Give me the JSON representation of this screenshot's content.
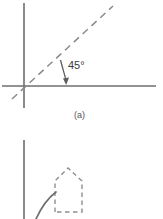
{
  "figure": {
    "background_color": "#ffffff",
    "ink_color": "#6e6e6e",
    "dash_color": "#8a8a8a",
    "panel_a": {
      "caption": "(a)",
      "angle_label": "45°",
      "axes": {
        "origin_x": 24,
        "origin_y": 86,
        "vertical_top_y": 3,
        "vertical_bottom_y": 108,
        "horizontal_left_x": 2,
        "horizontal_right_x": 156
      },
      "diagonal": {
        "style": "dashed",
        "angle_degrees": 45,
        "start_x": 12,
        "start_y": 99,
        "end_x": 113,
        "end_y": 6
      },
      "annotation_arrow": {
        "style": "curved-arrow",
        "from_x": 61,
        "from_y": 61,
        "to_x": 66,
        "to_y": 84,
        "points_to": "horizontal-axis"
      }
    },
    "panel_b": {
      "axis": {
        "vertical_x": 24,
        "vertical_top_y": 140,
        "vertical_bottom_y": 219
      },
      "dashed_shape": {
        "style": "dashed",
        "name": "pentagon-outline",
        "apex_x": 68,
        "apex_y": 168,
        "left_x": 55,
        "right_x": 82,
        "shoulder_y": 181,
        "base_y": 212
      },
      "curve": {
        "style": "solid",
        "start_x": 36,
        "start_y": 219,
        "end_x": 56,
        "end_y": 192
      }
    }
  }
}
